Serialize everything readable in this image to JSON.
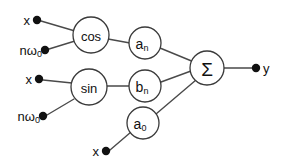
{
  "diagram": {
    "colors": {
      "background": "#ffffff",
      "edge": "#4a4a4a",
      "node_stroke": "#3a3a3a",
      "dot": "#111111",
      "text": "#111111"
    },
    "nodes": [
      {
        "id": "cos",
        "label": "cos",
        "cx": 91,
        "cy": 35,
        "r": 18
      },
      {
        "id": "a_n",
        "label": "a",
        "sub": "n",
        "cx": 145,
        "cy": 43,
        "r": 16
      },
      {
        "id": "sin",
        "label": "sin",
        "cx": 89,
        "cy": 87,
        "r": 18
      },
      {
        "id": "b_n",
        "label": "b",
        "sub": "n",
        "cx": 145,
        "cy": 86,
        "r": 16
      },
      {
        "id": "a_0",
        "label": "a",
        "sub": "0",
        "cx": 143,
        "cy": 123,
        "r": 16
      },
      {
        "id": "sigma",
        "label": "Σ",
        "cx": 207,
        "cy": 68,
        "r": 17
      }
    ],
    "inputs": [
      {
        "id": "x-top",
        "label": "x",
        "dot_x": 37,
        "dot_y": 20,
        "label_x": 30,
        "label_y": 20
      },
      {
        "id": "nw0-top",
        "label": "nω",
        "sub": "0",
        "dot_x": 45,
        "dot_y": 50,
        "label_x": 38,
        "label_y": 50
      },
      {
        "id": "x-mid",
        "label": "x",
        "dot_x": 39,
        "dot_y": 79,
        "label_x": 32,
        "label_y": 79
      },
      {
        "id": "nw0-mid",
        "label": "nω",
        "sub": "0",
        "dot_x": 43,
        "dot_y": 116,
        "label_x": 36,
        "label_y": 116
      },
      {
        "id": "x-bottom",
        "label": "x",
        "dot_x": 106,
        "dot_y": 151,
        "label_x": 99,
        "label_y": 151
      }
    ],
    "outputs": [
      {
        "id": "y",
        "label": "y",
        "dot_x": 256,
        "dot_y": 68,
        "label_x": 263,
        "label_y": 68
      }
    ],
    "edges": [
      {
        "id": "x-top-to-cos",
        "from": "x-top",
        "to": "cos",
        "x1": 41,
        "y1": 21,
        "x2": 75,
        "y2": 31
      },
      {
        "id": "nw0-top-to-cos",
        "from": "nw0-top",
        "to": "cos",
        "x1": 49,
        "y1": 49,
        "x2": 75,
        "y2": 41
      },
      {
        "id": "cos-to-an",
        "from": "cos",
        "to": "a_n",
        "x1": 108,
        "y1": 39,
        "x2": 130,
        "y2": 43
      },
      {
        "id": "an-to-sigma",
        "from": "a_n",
        "to": "sigma",
        "x1": 160,
        "y1": 48,
        "x2": 194,
        "y2": 62
      },
      {
        "id": "x-mid-to-sin",
        "from": "x-mid",
        "to": "sin",
        "x1": 43,
        "y1": 80,
        "x2": 72,
        "y2": 83
      },
      {
        "id": "nw0-mid-to-sin",
        "from": "nw0-mid",
        "to": "sin",
        "x1": 47,
        "y1": 115,
        "x2": 74,
        "y2": 99
      },
      {
        "id": "sin-to-bn",
        "from": "sin",
        "to": "b_n",
        "x1": 107,
        "y1": 86,
        "x2": 129,
        "y2": 86
      },
      {
        "id": "bn-to-sigma",
        "from": "b_n",
        "to": "sigma",
        "x1": 161,
        "y1": 82,
        "x2": 191,
        "y2": 71
      },
      {
        "id": "x-bottom-to-a0",
        "from": "x-bottom",
        "to": "a_0",
        "x1": 110,
        "y1": 150,
        "x2": 131,
        "y2": 132
      },
      {
        "id": "a0-to-sigma",
        "from": "a_0",
        "to": "sigma",
        "x1": 156,
        "y1": 114,
        "x2": 196,
        "y2": 80
      },
      {
        "id": "sigma-to-y",
        "from": "sigma",
        "to": "y",
        "x1": 224,
        "y1": 68,
        "x2": 252,
        "y2": 68
      }
    ]
  }
}
